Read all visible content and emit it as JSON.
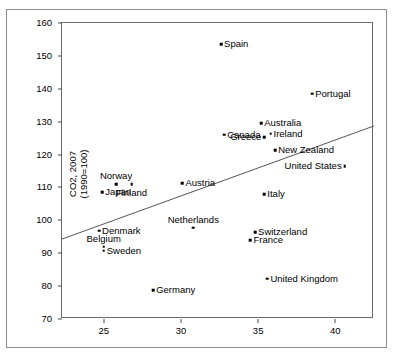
{
  "chart_data": {
    "type": "scatter",
    "title": "",
    "xlabel": "GINI",
    "ylabel": "CO2, 2007\n(1990=100)",
    "xlim": [
      22.3,
      42.5
    ],
    "ylim": [
      70,
      160
    ],
    "xticks": [
      25,
      30,
      35,
      40
    ],
    "yticks": [
      70,
      80,
      90,
      100,
      110,
      120,
      130,
      140,
      150,
      160
    ],
    "grid": false,
    "legend": null,
    "points": [
      {
        "label": "Spain",
        "x": 32.6,
        "y": 153.5,
        "label_pos": "right"
      },
      {
        "label": "Portugal",
        "x": 38.5,
        "y": 138.5,
        "label_pos": "right"
      },
      {
        "label": "Australia",
        "x": 35.2,
        "y": 129.5,
        "label_pos": "right"
      },
      {
        "label": "Canada",
        "x": 32.8,
        "y": 126.0,
        "label_pos": "right"
      },
      {
        "label": "Ireland",
        "x": 35.8,
        "y": 126.3,
        "label_pos": "right"
      },
      {
        "label": "Greece",
        "x": 35.4,
        "y": 125.2,
        "label_pos": "left"
      },
      {
        "label": "New Zealand",
        "x": 36.1,
        "y": 121.3,
        "label_pos": "right"
      },
      {
        "label": "United States",
        "x": 40.6,
        "y": 116.5,
        "label_pos": "left"
      },
      {
        "label": "Norway",
        "x": 25.8,
        "y": 111.0,
        "label_pos": "above"
      },
      {
        "label": "Finland",
        "x": 26.8,
        "y": 111.0,
        "label_pos": "below"
      },
      {
        "label": "Japan",
        "x": 24.9,
        "y": 108.5,
        "label_pos": "right"
      },
      {
        "label": "Austria",
        "x": 30.1,
        "y": 111.3,
        "label_pos": "right"
      },
      {
        "label": "Italy",
        "x": 35.4,
        "y": 107.9,
        "label_pos": "right"
      },
      {
        "label": "Netherlands",
        "x": 30.8,
        "y": 97.8,
        "label_pos": "above"
      },
      {
        "label": "Switzerland",
        "x": 34.8,
        "y": 96.4,
        "label_pos": "right"
      },
      {
        "label": "France",
        "x": 34.5,
        "y": 94.0,
        "label_pos": "right"
      },
      {
        "label": "Denmark",
        "x": 24.7,
        "y": 96.8,
        "label_pos": "right"
      },
      {
        "label": "Belgium",
        "x": 25.0,
        "y": 92.0,
        "label_pos": "above"
      },
      {
        "label": "Sweden",
        "x": 25.0,
        "y": 90.8,
        "label_pos": "right"
      },
      {
        "label": "Germany",
        "x": 28.2,
        "y": 78.8,
        "label_pos": "right"
      },
      {
        "label": "United Kingdom",
        "x": 35.6,
        "y": 82.3,
        "label_pos": "right"
      }
    ],
    "trend_line": {
      "x0": 22.3,
      "y0": 94.3,
      "x1": 42.5,
      "y1": 128.7
    }
  },
  "colors": {
    "point": "#000000",
    "axis": "#6b6b6b",
    "frame": "#8d8d8d",
    "text": "#000000",
    "trend": "#555555"
  }
}
